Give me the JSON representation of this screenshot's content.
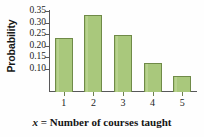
{
  "chart_data": {
    "type": "bar",
    "title": "",
    "subtitle": "",
    "xlabel": "x = Number of courses taught",
    "xlabel_variable": "x",
    "xlabel_rest": " = Number of courses taught",
    "ylabel": "Probability",
    "categories": [
      "1",
      "2",
      "3",
      "4",
      "5"
    ],
    "values": [
      0.233,
      0.334,
      0.245,
      0.125,
      0.07
    ],
    "series": [
      {
        "name": "Probability",
        "values": [
          0.233,
          0.334,
          0.245,
          0.125,
          0.07
        ]
      }
    ],
    "ylim": [
      0.0,
      0.355
    ],
    "xlim": [
      0.5,
      5.5
    ],
    "ytick_labels": [
      "0.35",
      "0.30",
      "0.25",
      "0.20",
      "0.15",
      "0.10"
    ],
    "ytick_values": [
      0.35,
      0.3,
      0.25,
      0.2,
      0.15,
      0.1
    ],
    "xtick_labels": [
      "1",
      "2",
      "3",
      "4",
      "5"
    ],
    "grid": false,
    "legend": false,
    "legend_position": "none",
    "bar_fill_color": "#a9c87c",
    "bar_edge_color": "#6f8a48",
    "axis_color": "#58585a",
    "background_color": "#fefefe",
    "text_color": "#1d1d1d"
  }
}
